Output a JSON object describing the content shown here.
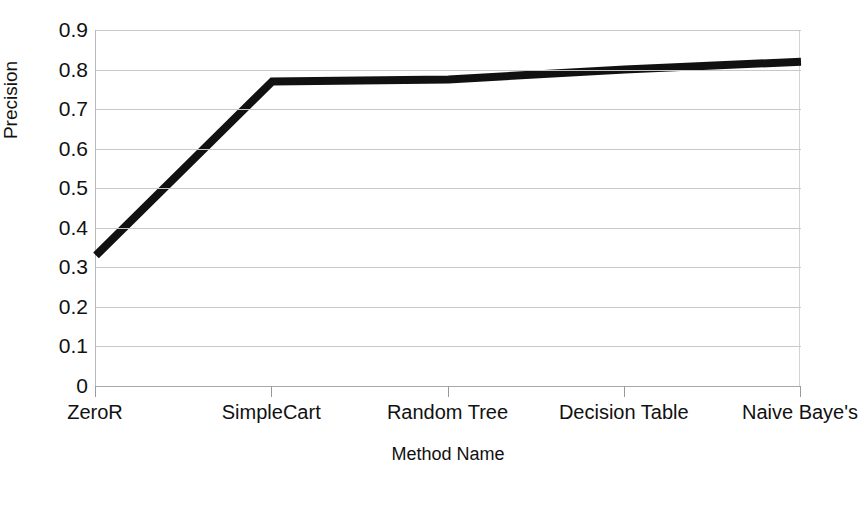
{
  "chart_data": {
    "type": "line",
    "title": "",
    "xlabel": "Method Name",
    "ylabel": "Precision",
    "categories": [
      "ZeroR",
      "SimpleCart",
      "Random Tree",
      "Decision Table",
      "Naive Baye's"
    ],
    "values": [
      0.33,
      0.77,
      0.775,
      0.8,
      0.82
    ],
    "series": [
      {
        "name": "Precision",
        "values": [
          0.33,
          0.77,
          0.775,
          0.8,
          0.82
        ],
        "color": "#111111"
      }
    ],
    "ylim": [
      0,
      0.9
    ],
    "ytick_values": [
      0,
      0.1,
      0.2,
      0.3,
      0.4,
      0.5,
      0.6,
      0.7,
      0.8,
      0.9
    ],
    "ytick_labels": [
      "0",
      "0.1",
      "0.2",
      "0.3",
      "0.4",
      "0.5",
      "0.6",
      "0.7",
      "0.8",
      "0.9"
    ],
    "grid": true,
    "grid_axis": "y",
    "legend": false,
    "legend_position": "none",
    "line_width_px": 8,
    "markers": false
  },
  "axes": {
    "y_title": "Precision",
    "x_title": "Method Name"
  },
  "colors": {
    "line": "#111111",
    "grid": "#c9c9cd",
    "axis": "#a8a8ac",
    "background": "#ffffff",
    "text": "#111111"
  }
}
